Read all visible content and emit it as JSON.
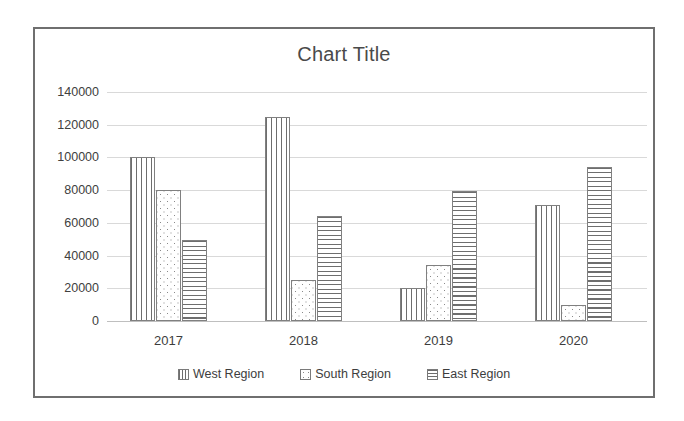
{
  "chart_data": {
    "type": "bar",
    "title": "Chart Title",
    "xlabel": "",
    "ylabel": "",
    "categories": [
      "2017",
      "2018",
      "2019",
      "2020"
    ],
    "series": [
      {
        "name": "West Region",
        "pattern": "vertical-lines",
        "values": [
          100000,
          125000,
          20000,
          71000
        ]
      },
      {
        "name": "South Region",
        "pattern": "dots",
        "values": [
          80000,
          25000,
          34000,
          10000
        ]
      },
      {
        "name": "East Region",
        "pattern": "horizontal-lines",
        "values": [
          49500,
          64500,
          79500,
          94000
        ]
      }
    ],
    "ylim": [
      0,
      140000
    ],
    "ytick_values": [
      0,
      20000,
      40000,
      60000,
      80000,
      100000,
      120000,
      140000
    ],
    "ytick_labels": [
      "0",
      "20000",
      "40000",
      "60000",
      "80000",
      "100000",
      "120000",
      "140000"
    ],
    "grid": true,
    "legend_position": "bottom",
    "colors": {
      "bar_outline": "#808080",
      "pattern": "#6e6e6e",
      "gridline": "#d9d9d9",
      "axis": "#bfbfbf",
      "title_text": "#4a4a4a",
      "label_text": "#3d3d3d",
      "frame_border": "#6f6f6f",
      "background": "#ffffff"
    }
  }
}
